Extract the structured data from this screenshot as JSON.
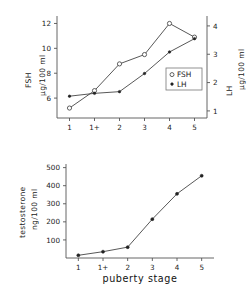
{
  "chart_data": [
    {
      "type": "line",
      "id": "fsh-lh-chart",
      "title": "",
      "xlabel": "",
      "categories": [
        "1",
        "1+",
        "2",
        "3",
        "4",
        "5"
      ],
      "grid": false,
      "legend_position": "center-right",
      "left_axis": {
        "label_main": "FSH",
        "label_units": "µg/100 ml",
        "ticks": [
          "12",
          "10",
          "8",
          "6"
        ],
        "tick_values": [
          12,
          10,
          8,
          6
        ],
        "ylim": [
          4.4,
          12.6
        ]
      },
      "right_axis": {
        "label_main": "LH",
        "label_units": "µg/100 ml",
        "ticks": [
          "4",
          "3",
          "2",
          "1"
        ],
        "tick_values": [
          4,
          3,
          2,
          1
        ],
        "ylim": [
          0.75,
          4.35
        ]
      },
      "series": [
        {
          "name": "FSH",
          "axis": "left",
          "marker": "open-circle",
          "values": [
            5.2,
            6.6,
            8.75,
            9.5,
            12.0,
            10.9
          ]
        },
        {
          "name": "LH",
          "axis": "right",
          "marker": "filled-dot",
          "values": [
            1.52,
            1.62,
            1.68,
            2.32,
            3.08,
            3.55
          ]
        }
      ],
      "legend": [
        {
          "label": "FSH",
          "marker": "open-circle"
        },
        {
          "label": "LH",
          "marker": "filled-dot"
        }
      ]
    },
    {
      "type": "line",
      "id": "testosterone-chart",
      "title": "",
      "xlabel": "puberty stage",
      "categories": [
        "1",
        "1+",
        "2",
        "3",
        "4",
        "5"
      ],
      "grid": false,
      "left_axis": {
        "label_main": "testosterone",
        "label_units": "ng/100 ml",
        "ticks": [
          "500",
          "400",
          "300",
          "200",
          "100"
        ],
        "tick_values": [
          500,
          400,
          300,
          200,
          100
        ],
        "ylim": [
          0,
          520
        ]
      },
      "series": [
        {
          "name": "testosterone",
          "axis": "left",
          "marker": "filled-dot",
          "values": [
            15,
            35,
            60,
            215,
            355,
            455
          ]
        }
      ]
    }
  ]
}
